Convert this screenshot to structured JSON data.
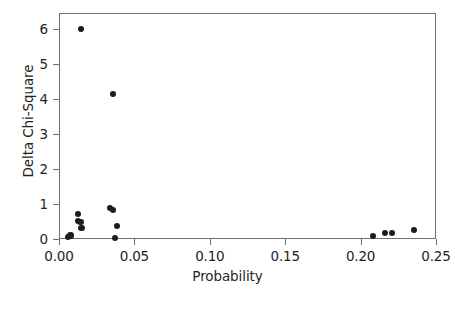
{
  "chart_data": {
    "type": "scatter",
    "title": "",
    "xlabel": "Probability",
    "ylabel": "Delta Chi-Square",
    "xlim": [
      0.0,
      0.25
    ],
    "ylim": [
      0.0,
      6.3
    ],
    "xticks": [
      "0.00",
      "0.05",
      "0.10",
      "0.15",
      "0.20",
      "0.25"
    ],
    "xtick_values": [
      0.0,
      0.05,
      0.1,
      0.15,
      0.2,
      0.25
    ],
    "yticks": [
      "0",
      "1",
      "2",
      "3",
      "4",
      "5",
      "6"
    ],
    "ytick_values": [
      0,
      1,
      2,
      3,
      4,
      5,
      6
    ],
    "grid": false,
    "legend": null,
    "marker": "filled-circle",
    "marker_color": "#1c1c1c",
    "frame_color": "#6f7072",
    "series": [
      {
        "name": "observations",
        "points": [
          {
            "x": 0.006,
            "y": 0.06
          },
          {
            "x": 0.0075,
            "y": 0.1
          },
          {
            "x": 0.0126,
            "y": 0.71
          },
          {
            "x": 0.0124,
            "y": 0.51
          },
          {
            "x": 0.0142,
            "y": 0.49
          },
          {
            "x": 0.0148,
            "y": 0.31
          },
          {
            "x": 0.0146,
            "y": 6.0
          },
          {
            "x": 0.0338,
            "y": 0.89
          },
          {
            "x": 0.036,
            "y": 0.83
          },
          {
            "x": 0.036,
            "y": 4.14
          },
          {
            "x": 0.0372,
            "y": 0.03
          },
          {
            "x": 0.0385,
            "y": 0.37
          },
          {
            "x": 0.2083,
            "y": 0.09
          },
          {
            "x": 0.2163,
            "y": 0.17
          },
          {
            "x": 0.221,
            "y": 0.17
          },
          {
            "x": 0.2355,
            "y": 0.26
          }
        ]
      }
    ]
  }
}
